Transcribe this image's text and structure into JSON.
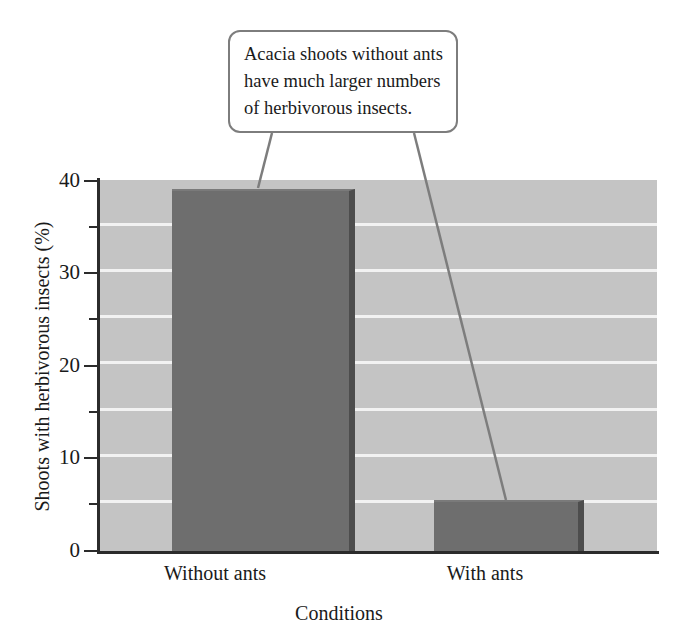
{
  "chart_data": {
    "type": "bar",
    "title": "",
    "categories": [
      "Without ants",
      "With ants"
    ],
    "values": [
      39,
      5.5
    ],
    "xlabel": "Conditions",
    "ylabel": "Shoots with herbivorous insects (%)",
    "ylim": [
      0,
      40
    ],
    "y_major_ticks": [
      0,
      10,
      20,
      30,
      40
    ],
    "y_minor_ticks": [
      5,
      15,
      25,
      35
    ],
    "y_tick_labels": [
      "0",
      "10",
      "20",
      "30",
      "40"
    ],
    "gridlines": {
      "axis": "y",
      "visible": true,
      "interval": 5,
      "color": "#f2f2f2"
    },
    "legend": {
      "visible": false,
      "position": "none"
    },
    "annotations": [
      {
        "text": "Acacia shoots without ants have much larger numbers of herbivorous insects.",
        "lines": [
          "Acacia shoots without ants",
          "have much larger numbers",
          "of herbivorous insects."
        ],
        "points_to": [
          "Without ants",
          "With ants"
        ]
      }
    ],
    "colors": {
      "plot_background": "#c4c4c4",
      "bar_fill": "#6e6e6e",
      "bar_shadow": "#4d4d4d",
      "gridline": "#f2f2f2",
      "axis": "#2b2b2b",
      "callout_border": "#7d7d7d",
      "callout_background": "#ffffff",
      "text": "#1a1a1a"
    }
  },
  "callout": {
    "line1": "Acacia shoots without ants",
    "line2": "have much larger numbers",
    "line3": "of herbivorous insects."
  },
  "axes": {
    "y_title": "Shoots with herbivorous insects (%)",
    "x_title": "Conditions",
    "y_labels": {
      "t0": "0",
      "t10": "10",
      "t20": "20",
      "t30": "30",
      "t40": "40"
    },
    "x_labels": {
      "cat0": "Without ants",
      "cat1": "With ants"
    }
  }
}
